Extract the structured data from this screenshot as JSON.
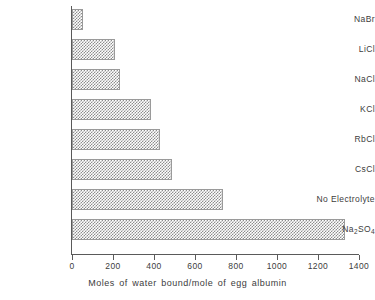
{
  "chart_data": {
    "type": "bar",
    "orientation": "horizontal",
    "title": "",
    "xlabel": "Moles of water bound/mole of egg albumin",
    "ylabel": "",
    "xlim": [
      0,
      1400
    ],
    "xticks": [
      0,
      200,
      400,
      600,
      800,
      1000,
      1200,
      1400
    ],
    "xtick_labels": [
      "0",
      "200",
      "400",
      "600",
      "800",
      "1000",
      "1200",
      "1400"
    ],
    "grid": false,
    "legend": null,
    "categories": [
      "NaBr",
      "LiCl",
      "NaCl",
      "KCl",
      "RbCl",
      "CsCl",
      "No Electrolyte",
      "Na2SO4"
    ],
    "category_labels_html": [
      "NaBr",
      "LiCl",
      "NaCl",
      "KCl",
      "RbCl",
      "CsCl",
      "No Electrolyte",
      "Na<sub>2</sub>SO<sub>4</sub>"
    ],
    "values": [
      54,
      210,
      235,
      385,
      430,
      490,
      735,
      1330
    ],
    "bar_fill": "gray-checker-hatch",
    "bar_edge_color": "#9a9a9a",
    "axis_color": "#5a5a5a"
  },
  "bars": [
    {
      "label": "NaBr",
      "label_html": "NaBr",
      "value": 54
    },
    {
      "label": "LiCl",
      "label_html": "LiCl",
      "value": 210
    },
    {
      "label": "NaCl",
      "label_html": "NaCl",
      "value": 235
    },
    {
      "label": "KCl",
      "label_html": "KCl",
      "value": 385
    },
    {
      "label": "RbCl",
      "label_html": "RbCl",
      "value": 430
    },
    {
      "label": "CsCl",
      "label_html": "CsCl",
      "value": 490
    },
    {
      "label": "No Electrolyte",
      "label_html": "No Electrolyte",
      "value": 735
    },
    {
      "label": "Na2SO4",
      "label_html": "Na<sub>2</sub>SO<sub>4</sub>",
      "value": 1330
    }
  ],
  "axis": {
    "x_title": "Moles of water bound/mole of egg albumin",
    "ticks": [
      "0",
      "200",
      "400",
      "600",
      "800",
      "1000",
      "1200",
      "1400"
    ]
  }
}
